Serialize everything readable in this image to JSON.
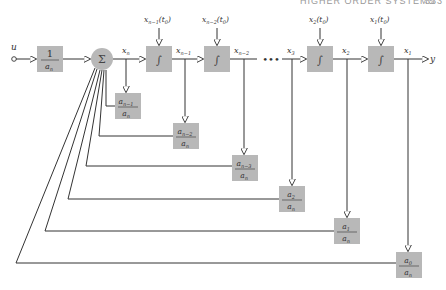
{
  "header": {
    "title": "HIGHER ORDER SYSTEMS",
    "page": "333"
  },
  "input": {
    "label": "u"
  },
  "output": {
    "label": "y"
  },
  "gain_block": {
    "numerator": "1",
    "denominator": "a",
    "den_sub": "n"
  },
  "summer": {
    "symbol": "Σ"
  },
  "integrator_symbol": "∫",
  "ellipsis": "•••",
  "signals": {
    "xn": {
      "base": "x",
      "sub": "n"
    },
    "xn1": {
      "base": "x",
      "sub": "n−1"
    },
    "xn2": {
      "base": "x",
      "sub": "n−2"
    },
    "x3": {
      "base": "x",
      "sub": "3"
    },
    "x2": {
      "base": "x",
      "sub": "2"
    },
    "x1": {
      "base": "x",
      "sub": "1"
    }
  },
  "initial_conditions": [
    {
      "base": "x",
      "sub": "n−1",
      "arg": "(t",
      "arg_sub": "0",
      "close": ")"
    },
    {
      "base": "x",
      "sub": "n−2",
      "arg": "(t",
      "arg_sub": "0",
      "close": ")"
    },
    {
      "base": "x",
      "sub": "2",
      "arg": "(t",
      "arg_sub": "0",
      "close": ")"
    },
    {
      "base": "x",
      "sub": "1",
      "arg": "(t",
      "arg_sub": "0",
      "close": ")"
    }
  ],
  "feedback_gains": [
    {
      "num": "a",
      "num_sub": "n−1",
      "den": "a",
      "den_sub": "n"
    },
    {
      "num": "a",
      "num_sub": "n−2",
      "den": "a",
      "den_sub": "n"
    },
    {
      "num": "a",
      "num_sub": "n−3",
      "den": "a",
      "den_sub": "n"
    },
    {
      "num": "a",
      "num_sub": "2",
      "den": "a",
      "den_sub": "n"
    },
    {
      "num": "a",
      "num_sub": "1",
      "den": "a",
      "den_sub": "n"
    },
    {
      "num": "a",
      "num_sub": "0",
      "den": "a",
      "den_sub": "n"
    }
  ],
  "colors": {
    "block_fill": "#b8b8b8",
    "line": "#333333",
    "background": "#ffffff"
  }
}
